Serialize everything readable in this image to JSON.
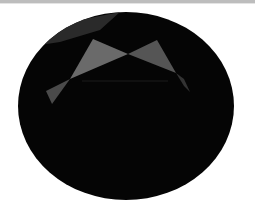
{
  "image": {
    "subject": "oval faceted dark gemstone",
    "background_color": "#ffffff",
    "top_strip_color": "#bdbdbd",
    "gem": {
      "body_color": "#050505",
      "center": [
        126,
        106
      ],
      "radii": [
        108,
        94
      ],
      "facets": [
        {
          "name": "upper-rim-facet",
          "color": "#2a2a2a"
        },
        {
          "name": "left-table-facet",
          "color": "#6a6a6a"
        },
        {
          "name": "right-table-facet",
          "color": "#555555"
        },
        {
          "name": "lower-left-facet",
          "color": "#4a4a4a"
        },
        {
          "name": "right-edge-facet",
          "color": "#333333"
        }
      ]
    }
  }
}
